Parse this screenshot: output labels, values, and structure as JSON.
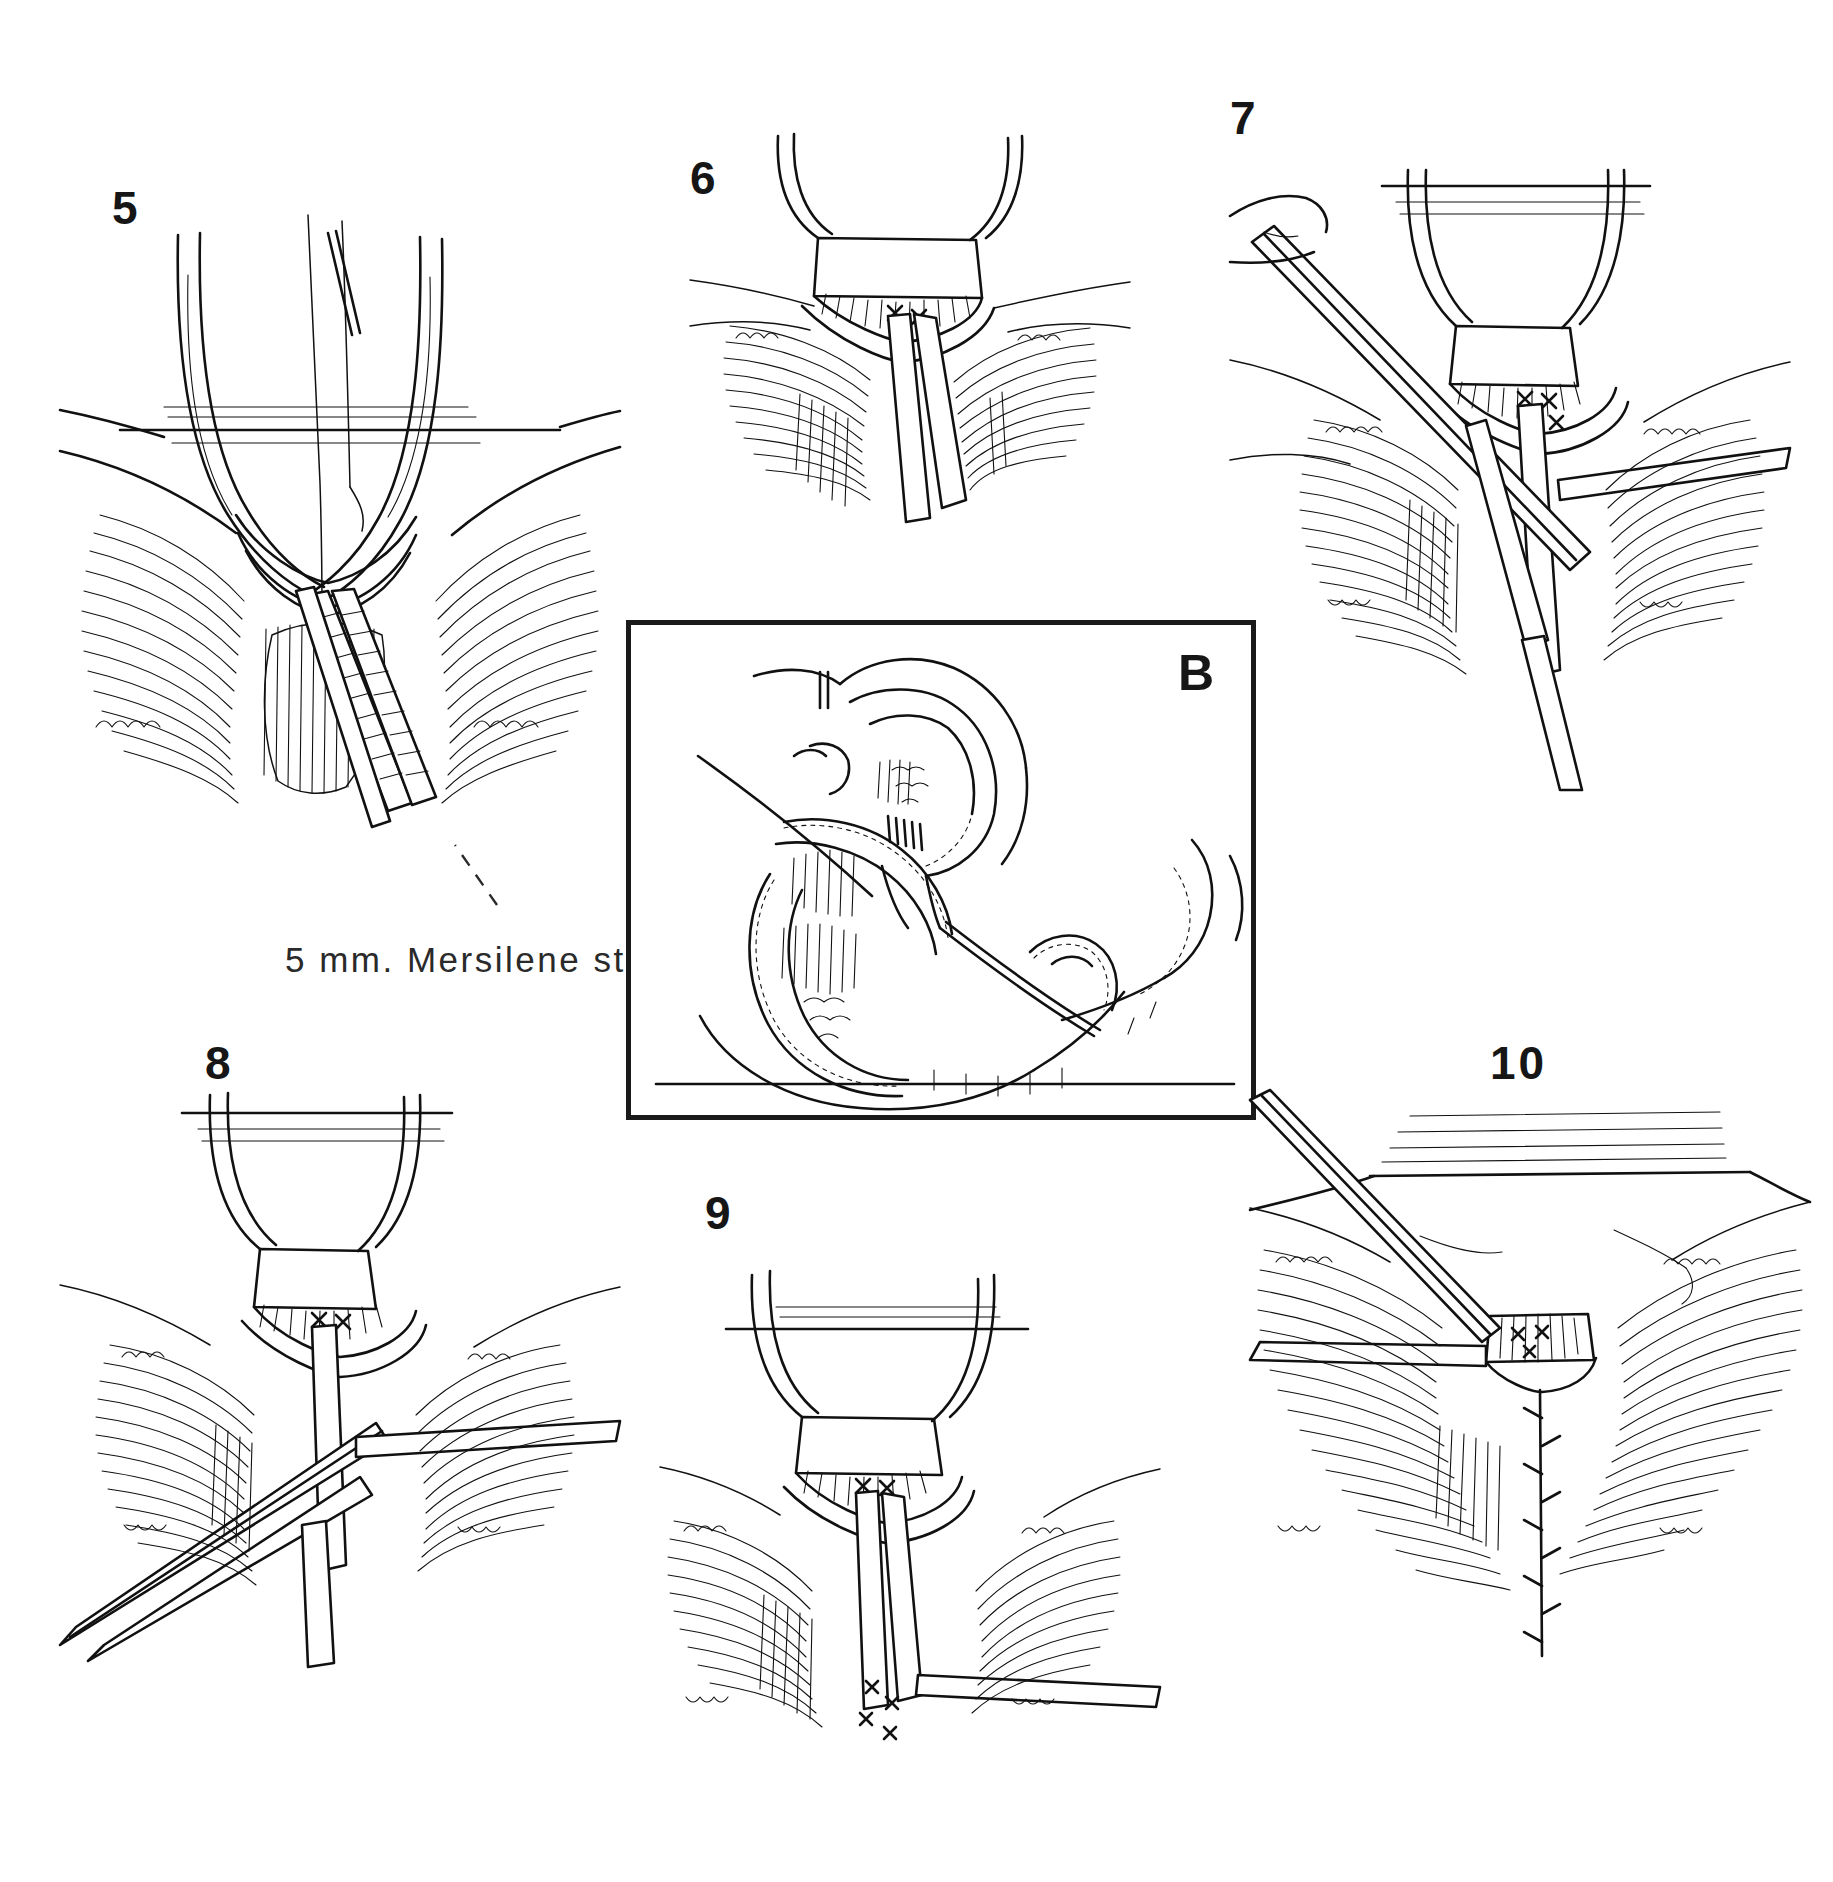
{
  "plate": {
    "background_color": "#ffffff",
    "ink_color": "#111111",
    "width": 1833,
    "height": 1882,
    "style": "pen-and-ink line-hatched surgical illustration"
  },
  "panels": [
    {
      "id": "panel-5",
      "number": "5",
      "number_x": 112,
      "number_y": 185,
      "art_x": 60,
      "art_y": 215,
      "art_w": 520,
      "art_h": 600,
      "description": "Retractor-held bladder neck with suture needle passing through; Mersilene strip grasped by forceps"
    },
    {
      "id": "panel-6",
      "number": "6",
      "number_x": 690,
      "number_y": 155,
      "art_x": 690,
      "art_y": 130,
      "art_w": 420,
      "art_h": 420,
      "description": "Close-up of urethra with strip positioned and anchoring stitches placed"
    },
    {
      "id": "panel-7",
      "number": "7",
      "number_x": 1230,
      "number_y": 95,
      "art_x": 1230,
      "art_y": 170,
      "art_w": 530,
      "art_h": 590,
      "description": "Forceps and hemostat retracting while strip is drawn beneath urethra"
    },
    {
      "id": "panel-8",
      "number": "8",
      "number_x": 205,
      "number_y": 1040,
      "art_x": 60,
      "art_y": 1085,
      "art_w": 520,
      "art_h": 560,
      "description": "Strip tensioned with clamp applied across the midline"
    },
    {
      "id": "panel-9",
      "number": "9",
      "number_x": 705,
      "number_y": 1190,
      "art_x": 660,
      "art_y": 1235,
      "art_w": 470,
      "art_h": 520,
      "description": "Strip secured distally with interrupted sutures in the deep field"
    },
    {
      "id": "panel-10",
      "number": "10",
      "number_x": 1490,
      "number_y": 1040,
      "art_x": 1250,
      "art_y": 1090,
      "art_w": 520,
      "art_h": 560,
      "description": "Completed closure with running suture line and forceps holding the apex"
    }
  ],
  "inset": {
    "id": "inset-b",
    "label": "B",
    "label_x": 1178,
    "label_y": 648,
    "frame_x": 626,
    "frame_y": 620,
    "frame_w": 630,
    "frame_h": 500,
    "description": "Sagittal section of pelvis showing bladder, urethra, pubic symphysis, vagina and rectum with the suspension strip in place"
  },
  "annotations": [
    {
      "id": "mersilene-callout",
      "text": "5 mm. Mersilene strip",
      "text_x": 285,
      "text_y": 940,
      "leader_from_x": 455,
      "leader_from_y": 905,
      "leader_to_x": 497,
      "leader_to_y": 845
    }
  ]
}
